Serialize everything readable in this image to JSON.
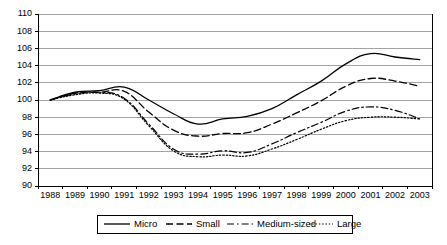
{
  "chart_data": {
    "type": "line",
    "title": "",
    "xlabel": "",
    "ylabel": "",
    "grid": "horizontal",
    "legend_position": "bottom",
    "ylim": [
      90,
      110
    ],
    "ytick_step": 2,
    "yticks": [
      "90",
      "92",
      "94",
      "96",
      "98",
      "100",
      "102",
      "104",
      "106",
      "108",
      "110"
    ],
    "categories": [
      "1988",
      "1989",
      "1990",
      "1991",
      "1992",
      "1993",
      "1994",
      "1995",
      "1996",
      "1997",
      "1998",
      "1999",
      "2000",
      "2001",
      "2002",
      "2003"
    ],
    "x": [
      1988,
      1989,
      1990,
      1991,
      1992,
      1993,
      1994,
      1995,
      1996,
      1997,
      1998,
      1999,
      2000,
      2001,
      2002,
      2003
    ],
    "series": [
      {
        "name": "Micro",
        "style": "solid",
        "values": [
          100.0,
          100.9,
          101.1,
          101.5,
          100.0,
          98.4,
          97.2,
          97.8,
          98.1,
          99.0,
          100.6,
          102.2,
          104.2,
          105.4,
          105.0,
          104.7
        ]
      },
      {
        "name": "Small",
        "style": "dashed",
        "values": [
          100.0,
          100.8,
          100.9,
          101.0,
          98.6,
          96.5,
          95.8,
          96.1,
          96.2,
          97.2,
          98.5,
          99.9,
          101.6,
          102.5,
          102.2,
          101.6
        ]
      },
      {
        "name": "Medium-sized",
        "style": "dash-dot",
        "values": [
          100.0,
          100.7,
          100.9,
          100.2,
          97.2,
          94.3,
          93.7,
          94.1,
          93.9,
          94.9,
          96.2,
          97.4,
          98.7,
          99.2,
          98.8,
          97.8
        ]
      },
      {
        "name": "Large",
        "style": "dotted",
        "values": [
          100.0,
          100.6,
          100.8,
          100.1,
          97.0,
          94.1,
          93.4,
          93.6,
          93.5,
          94.3,
          95.4,
          96.6,
          97.6,
          98.0,
          98.0,
          97.8
        ]
      }
    ]
  },
  "legend": {
    "entries": [
      {
        "label": "Micro"
      },
      {
        "label": "Small"
      },
      {
        "label": "Medium-sized"
      },
      {
        "label": "Large"
      }
    ]
  }
}
